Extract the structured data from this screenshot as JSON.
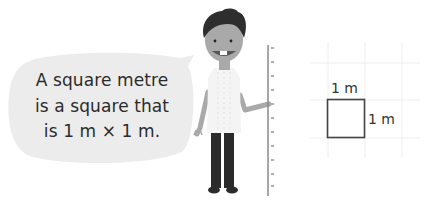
{
  "speech_bubble": {
    "lines": [
      "A square metre",
      "is a square that",
      "is 1 m × 1 m."
    ],
    "fill": "#ececec",
    "text_color": "#2b2b2b"
  },
  "character": {
    "hair_color": "#2e2e2e",
    "skin_color": "#a9a9a9",
    "shirt_color": "#f4f4f4",
    "trousers_color": "#2b2b2b"
  },
  "ruler": {
    "color": "#8a8a8a"
  },
  "diagram": {
    "top_label": "1 m",
    "side_label": "1 m",
    "grid_color": "#eeeeee",
    "square_stroke": "#444444"
  }
}
